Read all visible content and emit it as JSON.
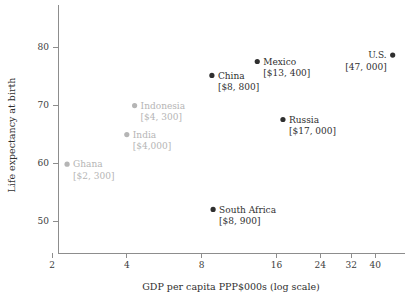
{
  "chart_data": {
    "type": "scatter",
    "title": "",
    "xlabel": "GDP per capita PPP$000s (log scale)",
    "ylabel": "Life expectancy at birth",
    "xscale": "log",
    "xlim": [
      2,
      45
    ],
    "ylim": [
      46,
      84
    ],
    "grid": false,
    "legend": "none",
    "xticks": [
      "2",
      "4",
      "8",
      "16",
      "24",
      "32",
      "40"
    ],
    "xtick_values": [
      2,
      4,
      8,
      16,
      24,
      32,
      40
    ],
    "yticks": [
      "50",
      "60",
      "70",
      "80"
    ],
    "ytick_values": [
      50,
      60,
      70,
      80
    ],
    "colors": {
      "highlight": "#2f2f2f",
      "muted": "#b5b5b5",
      "axis": "#8d8d8d"
    },
    "points": [
      {
        "name": "Ghana",
        "value_label": "[$2, 300]",
        "x": 2.3,
        "y": 59.8,
        "emphasis": "muted",
        "label_side": "right"
      },
      {
        "name": "India",
        "value_label": "[$4,000]",
        "x": 4.0,
        "y": 64.9,
        "emphasis": "muted",
        "label_side": "right"
      },
      {
        "name": "Indonesia",
        "value_label": "[$4, 300]",
        "x": 4.3,
        "y": 69.9,
        "emphasis": "muted",
        "label_side": "right"
      },
      {
        "name": "China",
        "value_label": "[$8, 800]",
        "x": 8.8,
        "y": 75.1,
        "emphasis": "highlight",
        "label_side": "right"
      },
      {
        "name": "South Africa",
        "value_label": "[$8, 900]",
        "x": 8.9,
        "y": 52.0,
        "emphasis": "highlight",
        "label_side": "right"
      },
      {
        "name": "Mexico",
        "value_label": "[$13, 400]",
        "x": 13.4,
        "y": 77.5,
        "emphasis": "highlight",
        "label_side": "right"
      },
      {
        "name": "Russia",
        "value_label": "[$17, 000]",
        "x": 17.0,
        "y": 67.5,
        "emphasis": "highlight",
        "label_side": "right"
      },
      {
        "name": "U.S.",
        "value_label": "[47, 000]",
        "x": 47.0,
        "y": 78.6,
        "emphasis": "highlight",
        "label_side": "left"
      }
    ]
  }
}
